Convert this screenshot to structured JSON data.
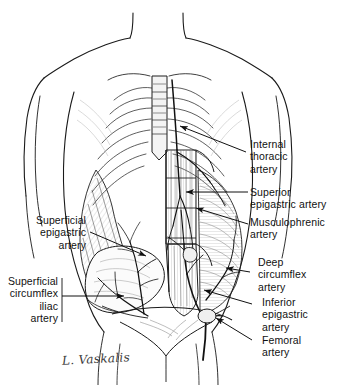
{
  "figure": {
    "background_color": "#ffffff",
    "ink_color": "#1a1a1a",
    "signature": "L. Vaskalis"
  },
  "labels": {
    "internal_thoracic": "Internal\nthoracic\nartery",
    "superior_epigastric": "Superior\nepigastric artery",
    "musculophrenic": "Musculophrenic\nartery",
    "deep_circumflex": "Deep\ncircumflex\nartery",
    "inferior_epigastric": "Inferior\nepigastric\nartery",
    "femoral": "Femoral\nartery",
    "superficial_epigastric": "Superficial\nepigastric\nartery",
    "superficial_circumflex_iliac": "Superficial\ncircumflex\niliac\nartery"
  },
  "icons": {
    "leader_line": "leader-line",
    "arrowhead": "arrowhead"
  }
}
